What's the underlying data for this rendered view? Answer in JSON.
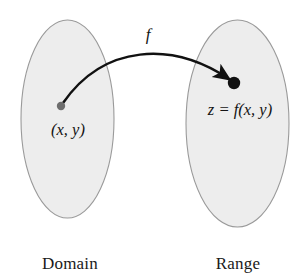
{
  "figure": {
    "type": "function-mapping-diagram",
    "background_color": "#ffffff",
    "domain": {
      "caption": "Domain",
      "point_label": "(x, y)",
      "ellipse": {
        "cx": 67.5,
        "cy": 119,
        "rx": 46.5,
        "ry": 99,
        "fill_color": "#ededed",
        "stroke_color": "#9a9a9a"
      },
      "point": {
        "cx": 61,
        "cy": 106,
        "r": 4.2,
        "color": "#6e6e6e"
      }
    },
    "range": {
      "caption": "Range",
      "point_label": "z = f(x, y)",
      "ellipse": {
        "cx": 237.5,
        "cy": 123.5,
        "rx": 51.5,
        "ry": 103.5,
        "fill_color": "#ededed",
        "stroke_color": "#9a9a9a"
      },
      "point": {
        "cx": 234,
        "cy": 83,
        "r": 6.2,
        "color": "#111111"
      }
    },
    "mapping_arrow": {
      "label": "f",
      "color": "#111111",
      "start": {
        "x": 63,
        "y": 103
      },
      "control_1": {
        "x": 104,
        "y": 44
      },
      "control_2": {
        "x": 172,
        "y": 41
      },
      "end": {
        "x": 229,
        "y": 79
      }
    }
  }
}
